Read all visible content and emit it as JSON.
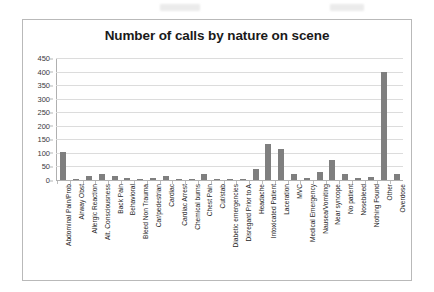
{
  "chart_data": {
    "type": "bar",
    "title": "Number of calls by nature on scene",
    "xlabel": "",
    "ylabel": "",
    "ylim": [
      0,
      450
    ],
    "ytick_step": 50,
    "yticks": [
      450,
      400,
      350,
      300,
      250,
      200,
      150,
      100,
      50,
      0
    ],
    "grid": true,
    "legend": false,
    "bar_color": "#7f7f7f",
    "categories": [
      "Abdominal Pain/Prob",
      "Airway Obst",
      "Allergic Reaction",
      "Alt. Consciousness",
      "Back Pain",
      "Behavioral",
      "Bleed Non Trauma",
      "Car/pedestrian",
      "Cardiac",
      "Cardiac Arrest",
      "Chemical burns",
      "Chest Pain",
      "Cut/stab",
      "Diabetic emergencies",
      "Disregard Prior to A",
      "Headache",
      "Intoxicated Patient",
      "Laceration",
      "MVC",
      "Medical Emergency",
      "Nausea/Vomiting",
      "Near syncope",
      "No patient",
      "Nosebleed",
      "Nothing Found",
      "Other",
      "Overdose"
    ],
    "values": [
      105,
      4,
      13,
      22,
      13,
      9,
      3,
      6,
      14,
      3,
      1,
      21,
      5,
      2,
      5,
      40,
      133,
      113,
      22,
      9,
      29,
      75,
      22,
      8,
      10,
      397,
      21
    ]
  },
  "scan": {
    "artifact_1": "",
    "artifact_2": ""
  }
}
